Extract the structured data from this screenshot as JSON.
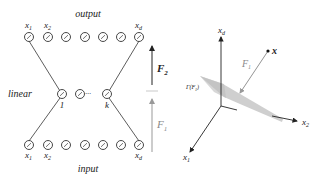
{
  "left_panel": {
    "top_label": "output",
    "bottom_label": "input",
    "middle_label": "linear",
    "output_nodes": [
      {
        "x": 29,
        "label": "x",
        "sub": "1"
      },
      {
        "x": 48,
        "label": "x",
        "sub": "2"
      },
      {
        "x": 66,
        "label": "",
        "sub": ""
      },
      {
        "x": 85,
        "label": "",
        "sub": ""
      },
      {
        "x": 103,
        "label": "",
        "sub": ""
      },
      {
        "x": 121,
        "label": "",
        "sub": ""
      },
      {
        "x": 139,
        "label": "x",
        "sub": "d"
      }
    ],
    "hidden_nodes": [
      {
        "x": 62,
        "label": "1"
      },
      {
        "x": 80,
        "label": ""
      },
      {
        "x": 107,
        "label": "k"
      }
    ],
    "hidden_ellipsis": "···",
    "arrow_upper_label": "F",
    "arrow_upper_sub": "2",
    "arrow_lower_label": "F",
    "arrow_lower_sub": "1"
  },
  "right_panel": {
    "axis_vertical": {
      "label": "x",
      "sub": "d"
    },
    "axis_right": {
      "label": "x",
      "sub": "2"
    },
    "axis_left": {
      "label": "x",
      "sub": "1"
    },
    "point_label": "x",
    "map_label": "F",
    "map_sub": "1",
    "surface_label": "Γ(F",
    "surface_sub": "1",
    "surface_close": ")"
  },
  "colors": {
    "line": "#333333",
    "node_stroke": "#333333",
    "surface": "#cfcfcf",
    "grey_arrow": "#999999",
    "text": "#222222"
  }
}
